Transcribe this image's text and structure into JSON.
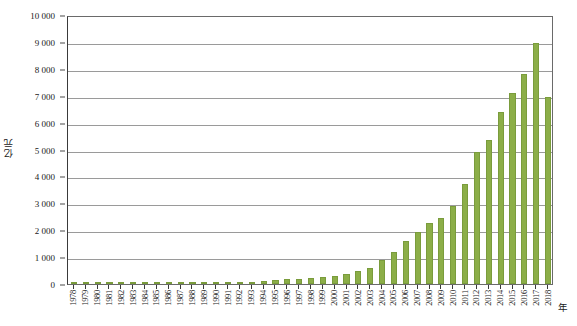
{
  "chart_data": {
    "type": "bar",
    "title": "",
    "subtitle": "",
    "xlabel": "年",
    "ylabel": "亿元",
    "ylim": [
      0,
      10000
    ],
    "ytick_step": 1000,
    "ytick_labels": [
      "0",
      "1 000",
      "2 000",
      "3 000",
      "4 000",
      "5 000",
      "6 000",
      "7 000",
      "8 000",
      "9 000",
      "10 000"
    ],
    "ytick_values": [
      0,
      1000,
      2000,
      3000,
      4000,
      5000,
      6000,
      7000,
      8000,
      9000,
      10000
    ],
    "grid": true,
    "legend": null,
    "legend_position": "none",
    "bar_color": "#8cae48",
    "bar_edge_color": "#7a9c3c",
    "categories": [
      "1978",
      "1979",
      "1980",
      "1981",
      "1982",
      "1983",
      "1984",
      "1985",
      "1986",
      "1987",
      "1988",
      "1989",
      "1990",
      "1991",
      "1992",
      "1993",
      "1994",
      "1995",
      "1996",
      "1997",
      "1998",
      "1999",
      "2000",
      "2001",
      "2002",
      "2003",
      "2004",
      "2005",
      "2006",
      "2007",
      "2008",
      "2009",
      "2010",
      "2011",
      "2012",
      "2013",
      "2014",
      "2015",
      "2016",
      "2017",
      "2018"
    ],
    "values": [
      10,
      12,
      14,
      16,
      18,
      20,
      25,
      30,
      35,
      40,
      45,
      50,
      55,
      60,
      70,
      90,
      110,
      150,
      180,
      200,
      230,
      260,
      300,
      380,
      480,
      600,
      900,
      1200,
      1600,
      1950,
      2250,
      2450,
      2900,
      3700,
      4900,
      5350,
      6400,
      7100,
      7800,
      8950,
      6950
    ]
  }
}
